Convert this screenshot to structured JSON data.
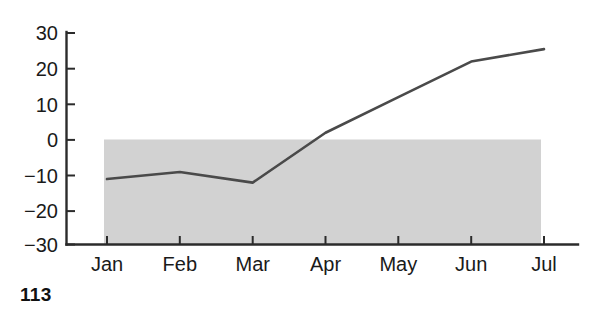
{
  "page": {
    "page_number": "113"
  },
  "chart_data": {
    "type": "line",
    "title": "",
    "subtitle": "",
    "xlabel": "",
    "ylabel": "",
    "categories": [
      "Jan",
      "Feb",
      "Mar",
      "Apr",
      "May",
      "Jun",
      "Jul"
    ],
    "values": [
      -11,
      -9,
      -12,
      2,
      12,
      22,
      25.5
    ],
    "series": [
      {
        "name": "",
        "values": [
          -11,
          -9,
          -12,
          2,
          12,
          22,
          25.5
        ]
      }
    ],
    "ylim": [
      -30,
      30
    ],
    "yticks": [
      30,
      20,
      10,
      0,
      -10,
      -20,
      -30
    ],
    "ytick_labels": [
      "30",
      "20",
      "10",
      "0",
      "−10",
      "−20",
      "−30"
    ],
    "xtick_labels": [
      "Jan",
      "Feb",
      "Mar",
      "Apr",
      "May",
      "Jun",
      "Jul"
    ],
    "grid": false,
    "legend": false,
    "legend_position": "none",
    "annotations": [],
    "shaded_region": {
      "label": "",
      "y_from": 0,
      "y_to": -30,
      "x_from": "Jan",
      "x_to": "Jul",
      "color": "#d2d2d2"
    },
    "colors": {
      "line": "#4a4a4a",
      "axis": "#2b2b2b",
      "shading": "#d2d2d2",
      "background": "#ffffff"
    }
  }
}
